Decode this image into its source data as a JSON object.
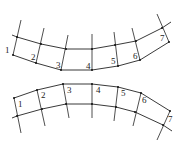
{
  "diagrams": [
    {
      "name": "top-arc-mesh",
      "labels": [
        "1",
        "2",
        "3",
        "4",
        "5",
        "6",
        "7"
      ],
      "line_color": "#222222"
    },
    {
      "name": "bottom-arc-mesh",
      "labels": [
        "1",
        "2",
        "3",
        "4",
        "5",
        "6",
        "7"
      ],
      "line_color": "#222222"
    }
  ]
}
